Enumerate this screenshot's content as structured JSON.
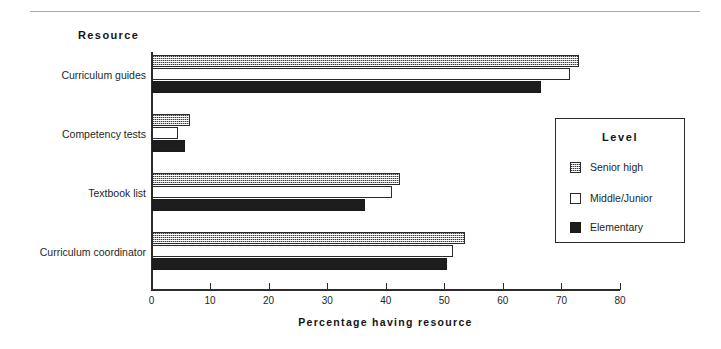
{
  "chart_data": {
    "type": "bar",
    "orientation": "horizontal",
    "title": "",
    "xlabel": "Percentage  having  resource",
    "ylabel": "Resource",
    "categories": [
      "Curriculum guides",
      "Competency tests",
      "Textbook list",
      "Curriculum coordinator"
    ],
    "series": [
      {
        "name": "Senior high",
        "values": [
          73,
          6.5,
          42.5,
          53.5
        ],
        "swatch": "checkered",
        "color": "#b4b4b4"
      },
      {
        "name": "Middle/Junior",
        "values": [
          71.5,
          4.5,
          41,
          51.5
        ],
        "swatch": "white",
        "color": "#ffffff"
      },
      {
        "name": "Elementary",
        "values": [
          66.5,
          5.8,
          36.5,
          50.5
        ],
        "swatch": "black",
        "color": "#1d1d1d"
      }
    ],
    "xlim": [
      0,
      80
    ],
    "xticks": [
      0,
      10,
      20,
      30,
      40,
      50,
      60,
      70,
      80
    ],
    "xtick_labels": [
      "0",
      "10",
      "20",
      "30",
      "40",
      "50",
      "60",
      "70",
      "80"
    ],
    "grid": false,
    "legend_position": "right"
  },
  "legend": {
    "title": "Level",
    "entries": [
      {
        "label": "Senior high"
      },
      {
        "label": "Middle/Junior"
      },
      {
        "label": "Elementary"
      }
    ]
  },
  "axis": {
    "y_caption": "Resource",
    "x_caption": "Percentage  having  resource"
  }
}
